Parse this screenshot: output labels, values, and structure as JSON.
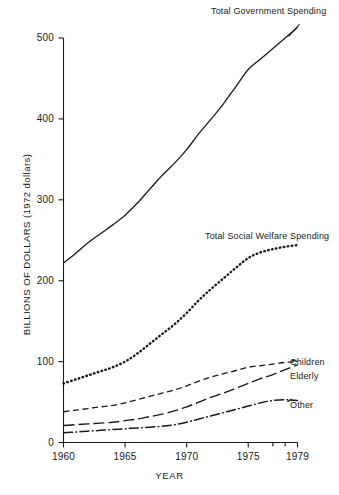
{
  "chart_data": {
    "type": "line",
    "title": "",
    "xlabel": "YEAR",
    "ylabel": "BILLIONS OF DOLLARS (1972 dollars)",
    "xlim": [
      1960,
      1979
    ],
    "ylim": [
      0,
      500
    ],
    "grid": false,
    "legend_position": "inline-right-annotations",
    "xticks": [
      1960,
      1965,
      1970,
      1975,
      1979
    ],
    "xtick_labels": [
      "1960",
      "1965",
      "1970",
      "1975",
      "1979"
    ],
    "minor_xticks": [
      1977,
      1978
    ],
    "yticks": [
      0,
      100,
      200,
      300,
      400,
      500
    ],
    "ytick_labels": [
      "0",
      "100",
      "200",
      "300",
      "400",
      "500"
    ],
    "x": [
      1960,
      1961,
      1962,
      1963,
      1964,
      1965,
      1966,
      1967,
      1968,
      1969,
      1970,
      1971,
      1972,
      1973,
      1974,
      1975,
      1976,
      1977,
      1978,
      1979
    ],
    "series": [
      {
        "name": "Total Government Spending",
        "style": "solid",
        "values": [
          222,
          234,
          247,
          258,
          269,
          281,
          296,
          313,
          330,
          345,
          362,
          382,
          400,
          419,
          440,
          461,
          474,
          487,
          500,
          513
        ]
      },
      {
        "name": "Total Social Welfare Spending",
        "style": "dotted",
        "values": [
          73,
          78,
          83,
          88,
          93,
          100,
          110,
          122,
          134,
          146,
          160,
          176,
          190,
          203,
          216,
          228,
          235,
          239,
          242,
          244
        ]
      },
      {
        "name": "Children",
        "style": "dashed",
        "values": [
          38,
          40,
          42,
          44,
          46,
          49,
          53,
          57,
          61,
          65,
          70,
          76,
          81,
          85,
          89,
          93,
          95,
          97,
          99,
          100
        ]
      },
      {
        "name": "Elderly",
        "style": "long-dash",
        "values": [
          21,
          22,
          23,
          24,
          25,
          27,
          29,
          32,
          35,
          39,
          44,
          50,
          56,
          61,
          67,
          73,
          79,
          84,
          90,
          96
        ]
      },
      {
        "name": "Other",
        "style": "dash-dot",
        "values": [
          12,
          13,
          14,
          15,
          16,
          17,
          18,
          19,
          20,
          22,
          25,
          29,
          33,
          37,
          41,
          45,
          49,
          52,
          53,
          52
        ]
      }
    ],
    "annotations": [
      {
        "text": "Total Government Spending",
        "series": "Total Government Spending"
      },
      {
        "text": "Total Social Welfare Spending",
        "series": "Total Social Welfare Spending"
      },
      {
        "text": "Children",
        "series": "Children"
      },
      {
        "text": "Elderly",
        "series": "Elderly"
      },
      {
        "text": "Other",
        "series": "Other"
      }
    ]
  }
}
